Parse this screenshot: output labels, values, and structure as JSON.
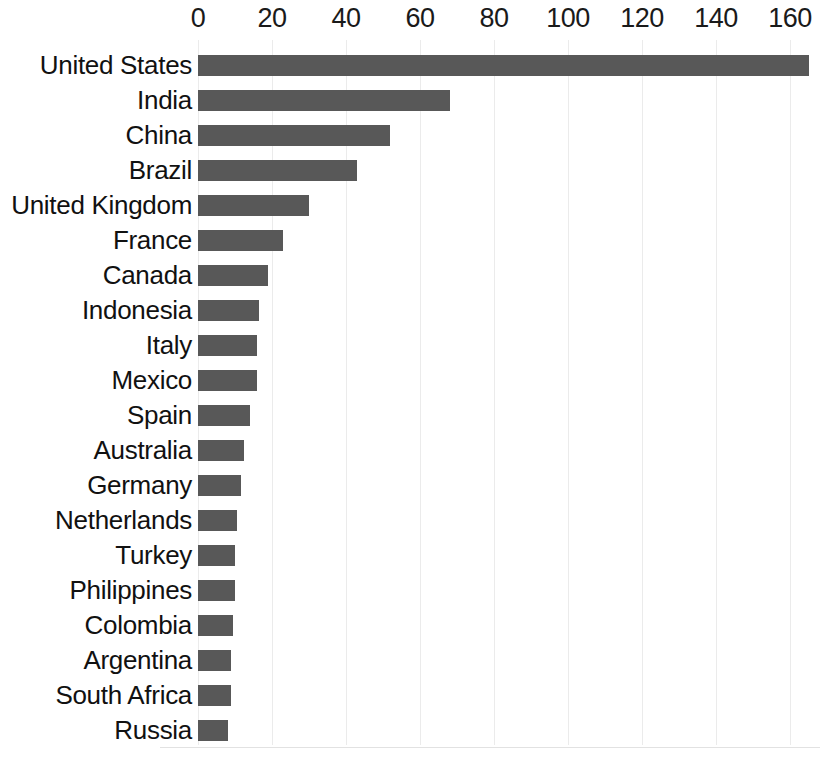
{
  "chart_data": {
    "type": "bar",
    "orientation": "horizontal",
    "title": "",
    "subtitle": "",
    "xlabel": "",
    "ylabel": "",
    "xlim": [
      0,
      168
    ],
    "axis_position": "top",
    "grid": true,
    "grid_axis": "x",
    "legend": false,
    "bar_color": "#585858",
    "grid_color": "#ebebeb",
    "text_color": "#111111",
    "xticks": [
      0,
      20,
      40,
      60,
      80,
      100,
      120,
      140,
      160
    ],
    "xtick_labels": [
      "0",
      "20",
      "40",
      "60",
      "80",
      "100",
      "120",
      "140",
      "160"
    ],
    "categories": [
      "United States",
      "India",
      "China",
      "Brazil",
      "United Kingdom",
      "France",
      "Canada",
      "Indonesia",
      "Italy",
      "Mexico",
      "Spain",
      "Australia",
      "Germany",
      "Netherlands",
      "Turkey",
      "Philippines",
      "Colombia",
      "Argentina",
      "South Africa",
      "Russia"
    ],
    "values": [
      165,
      68,
      52,
      43,
      30,
      23,
      19,
      16.5,
      16,
      16,
      14,
      12.5,
      11.5,
      10.5,
      10,
      10,
      9.5,
      9,
      9,
      8
    ]
  }
}
